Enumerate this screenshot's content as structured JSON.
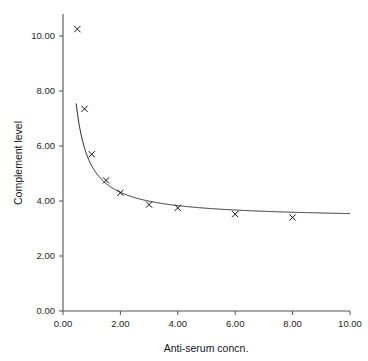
{
  "chart_data": {
    "type": "line",
    "title": "",
    "xlabel": "Anti-serum concn.",
    "ylabel": "Complement level",
    "xlim": [
      0,
      10
    ],
    "ylim": [
      0,
      10.8
    ],
    "grid": false,
    "legend": null,
    "x_ticks": [
      "0.00",
      "2.00",
      "4.00",
      "6.00",
      "8.00",
      "10.00"
    ],
    "x_tick_values": [
      0,
      2,
      4,
      6,
      8,
      10
    ],
    "y_ticks": [
      "0.00",
      "2.00",
      "4.00",
      "6.00",
      "8.00",
      "10.00"
    ],
    "y_tick_values": [
      0,
      2,
      4,
      6,
      8,
      10
    ],
    "marker_style": "x",
    "series": [
      {
        "name": "Complement level vs anti-serum concn.",
        "x": [
          0.5,
          0.75,
          1.0,
          1.5,
          2.0,
          3.0,
          4.0,
          6.0,
          8.0
        ],
        "values": [
          10.25,
          7.35,
          5.7,
          4.75,
          4.3,
          3.87,
          3.75,
          3.52,
          3.4
        ]
      }
    ],
    "fit_curve": {
      "form": "asymptotic-decay",
      "asymptote": 3.35,
      "x_start": 0.46,
      "x_end": 10.0
    },
    "colors": {
      "curve": "#2a2a2a",
      "marker": "#111111",
      "axis": "#555555",
      "text": "#1a1a1a",
      "background": "#ffffff"
    }
  }
}
